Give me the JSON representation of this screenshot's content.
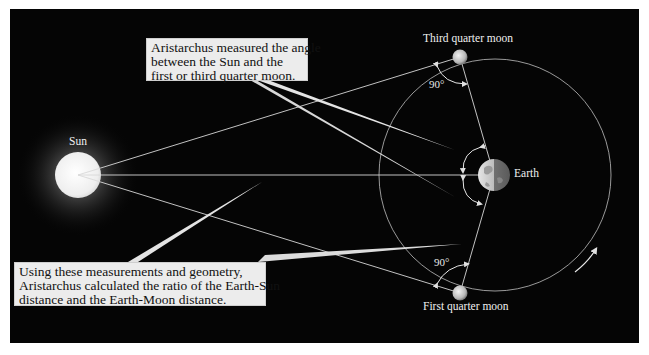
{
  "diagram": {
    "callouts": {
      "top": {
        "lines": [
          "Aristarchus measured the angle",
          "between the Sun and the",
          "first or third quarter moon."
        ]
      },
      "bottom": {
        "lines": [
          "Using these measurements and geometry,",
          "Aristarchus calculated the ratio of the Earth-Sun",
          "distance and the Earth-Moon distance."
        ]
      }
    },
    "labels": {
      "sun": "Sun",
      "earth": "Earth",
      "third_quarter_moon": "Third quarter moon",
      "first_quarter_moon": "First quarter moon",
      "angle_top": "90°",
      "angle_bottom": "90°"
    },
    "colors": {
      "background": "#050505",
      "lines": "#d8d8d8",
      "callout_fill": "#ececec",
      "sun": "#f4f4f4"
    }
  }
}
